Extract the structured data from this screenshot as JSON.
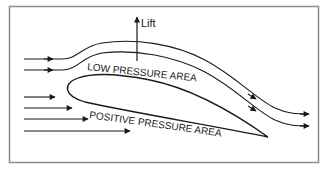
{
  "diagram": {
    "labels": {
      "lift": "Lift",
      "low_pressure": "LOW PRESSURE AREA",
      "positive_pressure": "POSITIVE PRESSURE AREA"
    },
    "colors": {
      "stroke": "#1a1a1a",
      "frame": "#8c8c8c",
      "background": "#ffffff"
    },
    "elements": {
      "airfoil": "cambered wing cross-section",
      "upper_streamlines": 2,
      "lower_straight_arrows": 4,
      "lift_arrow": "vertical arrow pointing up"
    }
  }
}
